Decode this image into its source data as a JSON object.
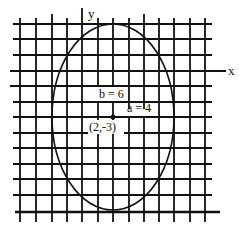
{
  "diagram": {
    "axes": {
      "x_label": "x",
      "y_label": "y"
    },
    "ellipse": {
      "center_label": "(2,-3)",
      "center": [
        2,
        -3
      ],
      "a_label": "a = 4",
      "b_label": "b = 6",
      "a": 4,
      "b": 6,
      "orientation": "vertical major axis"
    },
    "grid": {
      "unit_px": 15.3,
      "color": "#111111"
    }
  }
}
